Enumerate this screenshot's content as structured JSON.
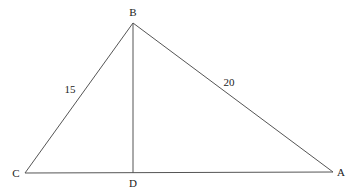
{
  "diagram": {
    "type": "geometry-triangle",
    "background": "#ffffff",
    "stroke_color": "#555555",
    "text_color": "#222222",
    "points": {
      "A": {
        "label": "A",
        "x": 333,
        "y": 172,
        "label_x": 341,
        "label_y": 176
      },
      "B": {
        "label": "B",
        "x": 133,
        "y": 23,
        "label_x": 133,
        "label_y": 16
      },
      "C": {
        "label": "C",
        "x": 25,
        "y": 173,
        "label_x": 16,
        "label_y": 177
      },
      "D": {
        "label": "D",
        "x": 133,
        "y": 173,
        "label_x": 133,
        "label_y": 187
      }
    },
    "segments": [
      {
        "name": "segment-bc",
        "from": "B",
        "to": "C"
      },
      {
        "name": "segment-ba",
        "from": "B",
        "to": "A"
      },
      {
        "name": "segment-ca",
        "from": "C",
        "to": "A"
      },
      {
        "name": "segment-bd",
        "from": "B",
        "to": "D"
      }
    ],
    "side_labels": {
      "bc": {
        "text": "15",
        "x": 70,
        "y": 93
      },
      "ba": {
        "text": "20",
        "x": 229,
        "y": 86
      }
    }
  }
}
